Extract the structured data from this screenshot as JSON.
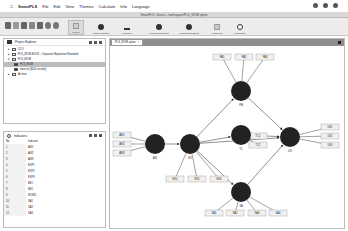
{
  "menubar": {
    "apple": "",
    "app_name": "SmartPLS",
    "items": [
      "File",
      "Edit",
      "View",
      "Themes",
      "Calculate",
      "Info",
      "Language"
    ]
  },
  "window": {
    "title": "SmartPLS: /Users/.../workspace/PLS_WOM.splsm"
  },
  "toolbar": {
    "buttons": [
      {
        "label": "Select",
        "icon": "cursor-icon"
      },
      {
        "label": "Latent Variable",
        "icon": "circle-icon"
      },
      {
        "label": "Connect",
        "icon": "arrow-icon"
      },
      {
        "label": "Moderating Effect",
        "icon": "person-icon"
      },
      {
        "label": "Moderating Effect",
        "icon": "person-icon"
      },
      {
        "label": "Comment",
        "icon": "note-icon"
      },
      {
        "label": "Calculate",
        "icon": "gear-icon"
      }
    ]
  },
  "project_explorer": {
    "title": "Project Explorer",
    "items": [
      {
        "label": "CCO",
        "level": 0,
        "selected": false
      },
      {
        "label": "PLS_WOM-BOOK - Corporate Reputation Extended",
        "level": 0,
        "selected": false
      },
      {
        "label": "PLS_WOM",
        "level": 0,
        "selected": false
      },
      {
        "label": "PLS_WOM",
        "level": 1,
        "selected": true
      },
      {
        "label": "wom.txt [4000 records]",
        "level": 1,
        "selected": false
      },
      {
        "label": "Archive",
        "level": 0,
        "selected": false
      }
    ]
  },
  "indicators": {
    "title": "Indicators",
    "columns": [
      "No.",
      "Indicator"
    ],
    "rows": [
      {
        "no": "1",
        "name": "AW1"
      },
      {
        "no": "2",
        "name": "AW2"
      },
      {
        "no": "3",
        "name": "AW3"
      },
      {
        "no": "4",
        "name": "EXP1"
      },
      {
        "no": "5",
        "name": "EXP2"
      },
      {
        "no": "6",
        "name": "EXP3"
      },
      {
        "no": "7",
        "name": "BE1"
      },
      {
        "no": "8",
        "name": "BE2"
      },
      {
        "no": "9",
        "name": "WOM1"
      },
      {
        "no": "10",
        "name": "SA1"
      },
      {
        "no": "11",
        "name": "SA2"
      },
      {
        "no": "12",
        "name": "SA3"
      }
    ]
  },
  "editor": {
    "tab_label": "PLS_WOM.splsm",
    "model": {
      "constructs": [
        {
          "id": "AW",
          "label": "AW"
        },
        {
          "id": "EX",
          "label": "EX"
        },
        {
          "id": "PA",
          "label": "PA"
        },
        {
          "id": "TC",
          "label": "TC"
        },
        {
          "id": "US",
          "label": "US"
        },
        {
          "id": "SA",
          "label": "SA"
        }
      ],
      "indicators": [
        {
          "label": "AW1",
          "construct": "AW"
        },
        {
          "label": "AW2",
          "construct": "AW"
        },
        {
          "label": "AW3",
          "construct": "AW"
        },
        {
          "label": "EX4",
          "construct": "EX"
        },
        {
          "label": "EX5",
          "construct": "EX"
        },
        {
          "label": "EX6",
          "construct": "EX"
        },
        {
          "label": "PA1",
          "construct": "PA"
        },
        {
          "label": "PA2",
          "construct": "PA"
        },
        {
          "label": "PA3",
          "construct": "PA"
        },
        {
          "label": "TC1",
          "construct": "TC"
        },
        {
          "label": "TC2",
          "construct": "TC"
        },
        {
          "label": "US1",
          "construct": "US"
        },
        {
          "label": "US2",
          "construct": "US"
        },
        {
          "label": "US3",
          "construct": "US"
        },
        {
          "label": "SA1",
          "construct": "SA"
        },
        {
          "label": "SA2",
          "construct": "SA"
        },
        {
          "label": "SA3",
          "construct": "SA"
        },
        {
          "label": "SA4",
          "construct": "SA"
        }
      ],
      "paths": [
        [
          "AW",
          "EX"
        ],
        [
          "EX",
          "PA"
        ],
        [
          "EX",
          "TC"
        ],
        [
          "EX",
          "US"
        ],
        [
          "EX",
          "SA"
        ],
        [
          "PA",
          "US"
        ],
        [
          "TC",
          "US"
        ],
        [
          "SA",
          "US"
        ]
      ]
    }
  }
}
